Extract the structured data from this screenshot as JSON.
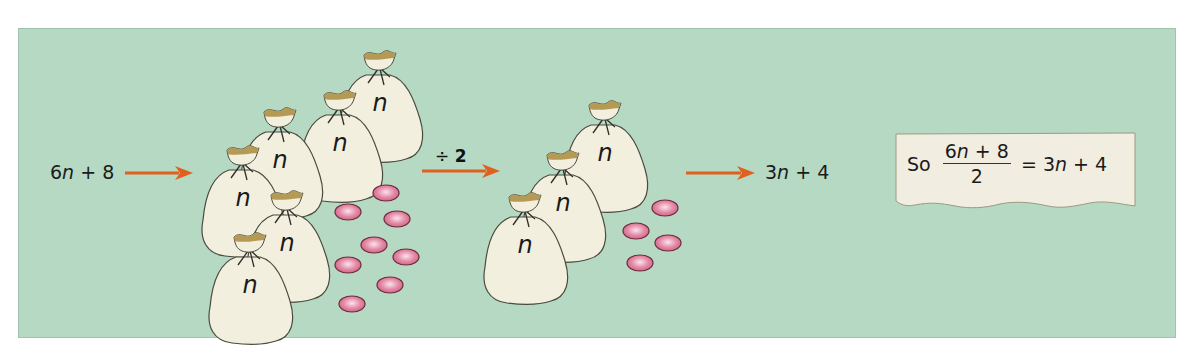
{
  "diagram": {
    "title": "",
    "start_expression": {
      "coef": "6",
      "var": "n",
      "op": " + ",
      "const": "8"
    },
    "operation_label": {
      "symbol": "÷ ",
      "value": "2"
    },
    "result_expression": {
      "coef": "3",
      "var": "n",
      "op": " + ",
      "const": "4"
    },
    "bag_label": "n",
    "groups": [
      {
        "name": "before",
        "bag_count": 6,
        "counter_count": 8
      },
      {
        "name": "after",
        "bag_count": 3,
        "counter_count": 4
      }
    ],
    "conclusion": {
      "prefix": "So",
      "numerator": {
        "coef": "6",
        "var": "n",
        "op": " + ",
        "const": "8"
      },
      "denominator": "2",
      "equals": " = ",
      "rhs": {
        "coef": "3",
        "var": "n",
        "op": " + ",
        "const": "4"
      }
    },
    "colors": {
      "background": "#b5d9c3",
      "bag": "#f2efdf",
      "bag_mouth": "#b59a55",
      "counter": "#e48aa6",
      "arrow": "#e0601f",
      "note_box": "#f1ede0"
    }
  }
}
